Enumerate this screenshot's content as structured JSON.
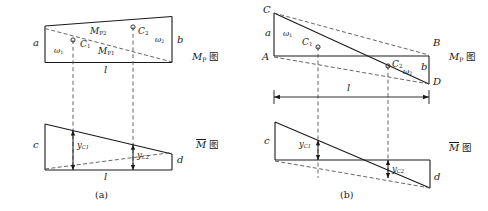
{
  "figure": {
    "caption_a": "(a)",
    "caption_b": "(b)",
    "titles": {
      "mp_label": "M",
      "mp_sub": "P",
      "mbar_label": "M",
      "tu_char": "图"
    }
  },
  "panel_a": {
    "mp_diagram": {
      "edge_left_label": "a",
      "edge_right_label": "b",
      "area1_symbol": "ω",
      "area1_sub": "1",
      "area2_symbol": "ω",
      "area2_sub": "2",
      "centroid1_label": "C",
      "centroid1_sub": "1",
      "centroid2_label": "C",
      "centroid2_sub": "2",
      "moment1_label": "M",
      "moment1_sub": "P1",
      "moment2_label": "M",
      "moment2_sub": "P2",
      "span_label": "l",
      "title_text": "M",
      "title_sub": "P",
      "title_suffix": "图"
    },
    "mbar_diagram": {
      "edge_left_label": "c",
      "edge_right_label": "d",
      "ordinate1_label": "y",
      "ordinate1_sub": "C1",
      "ordinate2_label": "y",
      "ordinate2_sub": "C2",
      "span_label": "l",
      "title_text": "M",
      "title_suffix": "图"
    }
  },
  "panel_b": {
    "mp_diagram": {
      "vertex_top_left": "C",
      "vertex_mid_left": "A",
      "vertex_top_right": "B",
      "vertex_bottom_right": "D",
      "edge_left_label": "a",
      "edge_right_label": "b",
      "area1_symbol": "ω",
      "area1_sub": "1",
      "area2_symbol": "ω",
      "area2_sub": "2",
      "centroid1_label": "C",
      "centroid1_sub": "1",
      "centroid2_label": "C",
      "centroid2_sub": "2",
      "span_label": "l",
      "title_text": "M",
      "title_sub": "P",
      "title_suffix": "图"
    },
    "mbar_diagram": {
      "edge_left_label": "c",
      "edge_right_label": "d",
      "ordinate1_label": "y",
      "ordinate1_sub": "C1",
      "ordinate2_label": "y",
      "ordinate2_sub": "C2",
      "title_text": "M",
      "title_suffix": "图"
    }
  },
  "colors": {
    "line": "#1a1a1a",
    "dash": "#555555",
    "background": "#ffffff"
  }
}
